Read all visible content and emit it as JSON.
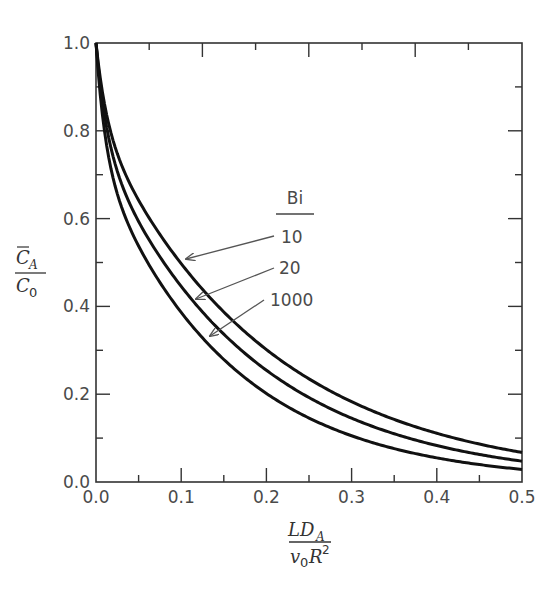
{
  "chart_data": {
    "type": "line",
    "title": "",
    "xlabel": "LD_A / (v_0 R^2)",
    "ylabel": "C̄_A / C_0",
    "xlim": [
      0.0,
      0.5
    ],
    "ylim": [
      0.0,
      1.0
    ],
    "x_ticks": [
      "0.0",
      "0.1",
      "0.2",
      "0.3",
      "0.4",
      "0.5"
    ],
    "y_ticks": [
      "0.0",
      "0.2",
      "0.4",
      "0.6",
      "0.8",
      "1.0"
    ],
    "grid": false,
    "legend_title": "Bi",
    "legend_position": "inside, center",
    "series": [
      {
        "name": "10",
        "x": [
          0.0,
          0.027,
          0.069,
          0.1,
          0.134,
          0.2,
          0.3,
          0.4,
          0.5
        ],
        "y": [
          1.0,
          0.8,
          0.6,
          0.505,
          0.4,
          0.317,
          0.191,
          0.134,
          0.082
        ]
      },
      {
        "name": "20",
        "x": [
          0.0,
          0.019,
          0.052,
          0.1,
          0.113,
          0.2,
          0.3,
          0.4,
          0.5
        ],
        "y": [
          1.0,
          0.8,
          0.6,
          0.45,
          0.4,
          0.273,
          0.159,
          0.103,
          0.062
        ]
      },
      {
        "name": "1000",
        "x": [
          0.0,
          0.013,
          0.038,
          0.095,
          0.1,
          0.2,
          0.3,
          0.4,
          0.5
        ],
        "y": [
          1.0,
          0.8,
          0.6,
          0.4,
          0.41,
          0.232,
          0.125,
          0.073,
          0.041
        ]
      }
    ]
  },
  "labels": {
    "y_num_main": "C",
    "y_num_sub": "A",
    "y_den_main": "C",
    "y_den_sub": "0",
    "x_num_main": "LD",
    "x_num_sub": "A",
    "x_den_v": "v",
    "x_den_sub": "0",
    "x_den_R": "R",
    "x_den_sup": "2",
    "legend_title": "Bi",
    "legend_10": "10",
    "legend_20": "20",
    "legend_1000": "1000"
  }
}
